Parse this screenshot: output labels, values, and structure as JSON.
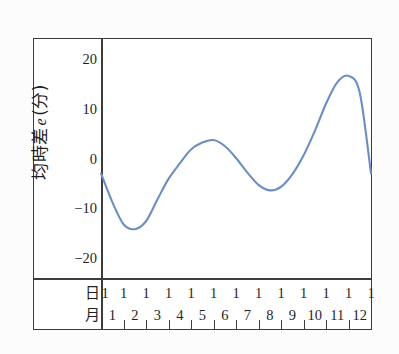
{
  "chart_data": {
    "type": "line",
    "title": "",
    "xlabel": "",
    "ylabel": "均時差 e (分)",
    "ylabel_parts": {
      "prefix": "均時差",
      "variable": "e",
      "suffix": "(分)"
    },
    "ylim": [
      -24,
      24
    ],
    "y_ticks": [
      20,
      10,
      0,
      -10,
      -20
    ],
    "y_tick_labels": [
      "20",
      "10",
      "0",
      "−10",
      "−20"
    ],
    "grid": false,
    "legend": null,
    "x_axis_table": {
      "row_labels": [
        "日",
        "月"
      ],
      "day_values": [
        "1",
        "1",
        "1",
        "1",
        "1",
        "1",
        "1",
        "1",
        "1",
        "1",
        "1",
        "1",
        "1"
      ],
      "month_values": [
        "1",
        "2",
        "3",
        "4",
        "5",
        "6",
        "7",
        "8",
        "9",
        "10",
        "11",
        "12"
      ]
    },
    "series": [
      {
        "name": "equation of time",
        "color": "#6b8ec6",
        "x": [
          0,
          0.5,
          1,
          1.5,
          2,
          2.5,
          3,
          3.5,
          4,
          4.5,
          5,
          5.5,
          6,
          6.5,
          7,
          7.5,
          8,
          8.5,
          9,
          9.5,
          10,
          10.5,
          11,
          11.5,
          12
        ],
        "values": [
          -3.0,
          -8.7,
          -13.2,
          -14.2,
          -12.6,
          -8.3,
          -4.1,
          -1.0,
          1.8,
          3.2,
          3.7,
          2.5,
          0.1,
          -2.8,
          -5.3,
          -6.4,
          -5.7,
          -3.2,
          0.6,
          5.5,
          11.0,
          15.3,
          16.6,
          13.2,
          -3.0
        ]
      }
    ],
    "annotations": {
      "minimum_label": "-14 around February 11",
      "maximum_label": "+16.6 around November 3"
    }
  }
}
